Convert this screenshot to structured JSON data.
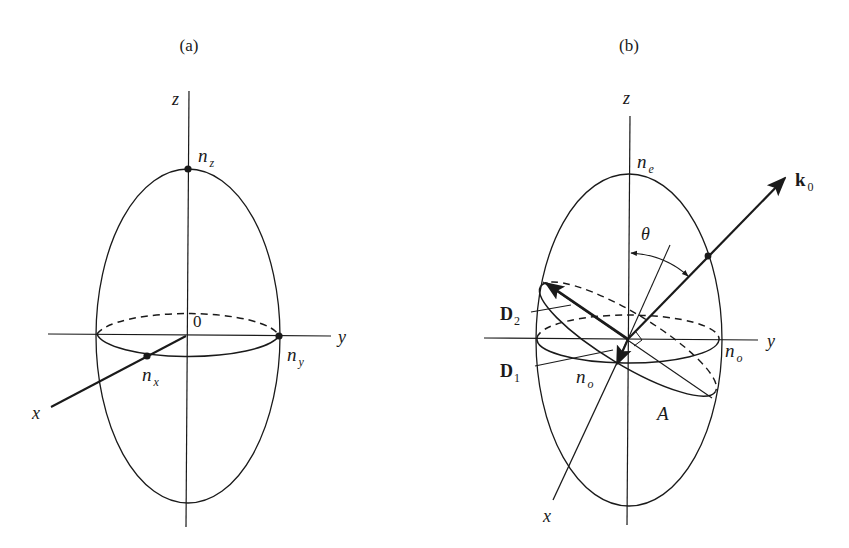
{
  "figure": {
    "panel_a": {
      "caption": "(a)",
      "axis_labels": {
        "z": "z",
        "y": "y",
        "x": "x",
        "origin": "0"
      },
      "points": {
        "nz": {
          "base": "n",
          "sub": "z"
        },
        "ny": {
          "base": "n",
          "sub": "y"
        },
        "nx": {
          "base": "n",
          "sub": "x"
        }
      }
    },
    "panel_b": {
      "caption": "(b)",
      "axis_labels": {
        "z": "z",
        "y": "y",
        "x": "x"
      },
      "angle_label": "θ",
      "optic_axis_label": "A",
      "wave_vector": {
        "base": "k",
        "sub": "0"
      },
      "field_vectors": [
        {
          "base": "D",
          "sub": "2"
        },
        {
          "base": "D",
          "sub": "1"
        }
      ],
      "points": {
        "ne": {
          "base": "n",
          "sub": "e"
        },
        "no_right": {
          "base": "n",
          "sub": "o"
        },
        "no_front": {
          "base": "n",
          "sub": "o"
        }
      }
    },
    "colors": {
      "ink": "#1a1a1a",
      "background": "#ffffff"
    }
  }
}
